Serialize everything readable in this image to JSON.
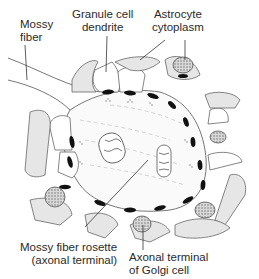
{
  "figure": {
    "labels": {
      "mossy_fiber": {
        "line1": "Mossy",
        "line2": "fiber"
      },
      "granule_cell_dendrite": {
        "line1": "Granule cell",
        "line2": "dendrite"
      },
      "astrocyte_cytoplasm": {
        "line1": "Astrocyte",
        "line2": "cytoplasm"
      },
      "mossy_fiber_rosette": {
        "line1": "Mossy fiber rosette",
        "line2": "(axonal terminal)"
      },
      "golgi_terminal": {
        "line1": "Axonal terminal",
        "line2": "of Golgi cell"
      }
    },
    "colors": {
      "stroke": "#555555",
      "fill_gray": "#e6e6e6",
      "synapse": "#111111",
      "background": "#ffffff"
    }
  }
}
